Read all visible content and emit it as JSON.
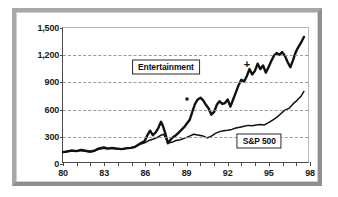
{
  "chart_data": {
    "type": "line",
    "title": "",
    "subtitle": "",
    "xlabel": "",
    "ylabel": "",
    "xlim": [
      80,
      98
    ],
    "ylim": [
      0,
      1500
    ],
    "grid": true,
    "legend_position": "inline-callout",
    "y_ticks": [
      "0",
      "300",
      "600",
      "900",
      "1,200",
      "1,500"
    ],
    "y_tick_values": [
      0,
      300,
      600,
      900,
      1200,
      1500
    ],
    "x_ticks": [
      "80",
      "83",
      "86",
      "89",
      "92",
      "95",
      "98"
    ],
    "x_tick_values": [
      80,
      83,
      86,
      89,
      92,
      95,
      98
    ],
    "x_minor_tick_values": [
      80,
      81,
      82,
      83,
      84,
      85,
      86,
      87,
      88,
      89,
      90,
      91,
      92,
      93,
      94,
      95,
      96,
      97,
      98
    ],
    "series": [
      {
        "name": "Entertainment",
        "label": "Entertainment",
        "color": "#111111",
        "width": 2.4,
        "x": [
          80.0,
          80.3,
          80.6,
          81.0,
          81.3,
          81.6,
          82.0,
          82.3,
          82.6,
          83.0,
          83.3,
          83.6,
          84.0,
          84.3,
          84.6,
          85.0,
          85.3,
          85.6,
          86.0,
          86.2,
          86.4,
          86.6,
          86.8,
          87.0,
          87.2,
          87.35,
          87.5,
          87.7,
          87.9,
          88.1,
          88.3,
          88.5,
          88.7,
          88.9,
          89.1,
          89.3,
          89.5,
          89.7,
          89.9,
          90.1,
          90.3,
          90.5,
          90.7,
          90.9,
          91.1,
          91.3,
          91.5,
          91.7,
          91.9,
          92.1,
          92.3,
          92.5,
          92.7,
          92.9,
          93.1,
          93.3,
          93.5,
          93.7,
          93.9,
          94.1,
          94.3,
          94.5,
          94.7,
          94.9,
          95.1,
          95.3,
          95.5,
          95.7,
          95.9,
          96.1,
          96.3,
          96.5,
          96.7,
          96.9,
          97.1,
          97.3,
          97.5,
          97.7
        ],
        "y": [
          110,
          118,
          128,
          122,
          134,
          128,
          118,
          126,
          150,
          162,
          150,
          158,
          150,
          144,
          152,
          158,
          170,
          200,
          235,
          300,
          350,
          300,
          330,
          380,
          450,
          400,
          330,
          210,
          250,
          280,
          300,
          330,
          360,
          390,
          430,
          470,
          560,
          650,
          700,
          720,
          690,
          640,
          600,
          530,
          560,
          640,
          680,
          650,
          660,
          700,
          620,
          700,
          780,
          860,
          920,
          900,
          960,
          1040,
          980,
          1020,
          1100,
          1040,
          1080,
          1000,
          1060,
          1130,
          1190,
          1220,
          1200,
          1230,
          1190,
          1120,
          1060,
          1140,
          1230,
          1290,
          1340,
          1400
        ]
      },
      {
        "name": "S&P 500",
        "label": "S&P 500",
        "color": "#111111",
        "width": 1.5,
        "x": [
          80.0,
          80.3,
          80.6,
          81.0,
          81.3,
          81.6,
          82.0,
          82.3,
          82.6,
          83.0,
          83.3,
          83.6,
          84.0,
          84.3,
          84.6,
          85.0,
          85.3,
          85.6,
          86.0,
          86.3,
          86.6,
          87.0,
          87.2,
          87.4,
          87.6,
          87.8,
          88.0,
          88.3,
          88.6,
          89.0,
          89.3,
          89.6,
          90.0,
          90.3,
          90.6,
          90.9,
          91.2,
          91.5,
          91.8,
          92.1,
          92.4,
          92.7,
          93.0,
          93.3,
          93.6,
          93.9,
          94.2,
          94.5,
          94.8,
          95.1,
          95.4,
          95.7,
          96.0,
          96.3,
          96.6,
          96.9,
          97.2,
          97.5,
          97.7
        ],
        "y": [
          108,
          118,
          126,
          120,
          130,
          120,
          112,
          122,
          142,
          155,
          150,
          152,
          146,
          142,
          150,
          160,
          175,
          195,
          215,
          240,
          255,
          280,
          300,
          310,
          250,
          215,
          220,
          240,
          250,
          270,
          290,
          310,
          300,
          290,
          270,
          290,
          320,
          340,
          350,
          355,
          365,
          380,
          390,
          400,
          410,
          405,
          415,
          420,
          415,
          440,
          470,
          500,
          540,
          580,
          600,
          650,
          690,
          740,
          790
        ]
      }
    ],
    "annotations": [
      {
        "name": "square-marker",
        "glyph": "square",
        "x": 89.0,
        "y": 720
      },
      {
        "name": "plus-marker",
        "glyph": "+",
        "x": 93.4,
        "y": 1105
      }
    ],
    "callouts": [
      {
        "name": "entertainment-callout",
        "text": "Entertainment",
        "x": 87.5,
        "y": 1075
      },
      {
        "name": "sp500-callout",
        "text": "S&P 500",
        "x": 94.3,
        "y": 255
      }
    ]
  }
}
